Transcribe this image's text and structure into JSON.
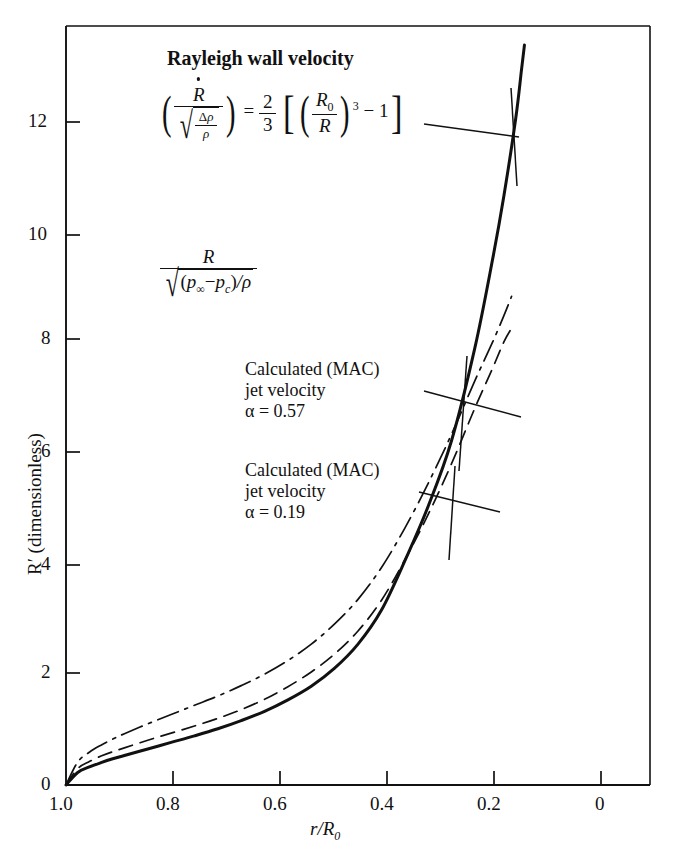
{
  "figure": {
    "kind": "scientific-line-chart",
    "background": "#ffffff",
    "ink": "#111111"
  },
  "axes": {
    "x": {
      "title_parts": {
        "r": "r",
        "slash": "/",
        "R": "R",
        "zero": "0"
      },
      "ticks": [
        "1.0",
        "0.8",
        "0.6",
        "0.4",
        "0.2",
        "0"
      ],
      "min": 1.0,
      "max": 0.0,
      "direction": "reversed"
    },
    "y": {
      "title": "R′ (dimensionless)",
      "ticks": [
        "0",
        "2",
        "4",
        "6",
        "8",
        "10",
        "12"
      ],
      "min": 0,
      "max": 13.9
    }
  },
  "annotations": {
    "rayleigh": {
      "headline": "Rayleigh wall velocity",
      "equation_text": "(Ṙ / √(Δρ/ρ)) = (2/3)[(R₀/R)³ − 1]",
      "parts": {
        "Rdot": "R",
        "delta": "Δ",
        "rho": "ρ",
        "equals": "=",
        "two": "2",
        "three": "3",
        "R0_R": "R",
        "sub0": "0",
        "R": "R",
        "exp3": "3",
        "minus": "−",
        "one": "1"
      }
    },
    "normalizer": {
      "equation_text": "R / √((p∞ − p_c)/ρ)",
      "parts": {
        "R": "R",
        "pinf": "p",
        "inf": "∞",
        "minus": "−",
        "pc": "p",
        "c": "c",
        "slashrho": "/ρ"
      }
    },
    "mac1": {
      "line1": "Calculated (MAC)",
      "line2": "jet velocity",
      "line3_prefix": "α = ",
      "alpha_value": "0.57"
    },
    "mac2": {
      "line1": "Calculated (MAC)",
      "line2": "jet velocity",
      "line3_prefix": "α = ",
      "alpha_value": "0.19"
    }
  },
  "chart_data": {
    "type": "line",
    "title": "",
    "xlabel": "r/R0",
    "ylabel": "R' (dimensionless)",
    "xlim": [
      1.0,
      0.0
    ],
    "ylim": [
      0,
      13.9
    ],
    "xticks": [
      1.0,
      0.8,
      0.6,
      0.4,
      0.2,
      0.0
    ],
    "yticks": [
      0,
      2,
      4,
      6,
      8,
      10,
      12
    ],
    "grid": false,
    "legend": "annotated-with-leader-lines",
    "x_axis_reversed": true,
    "series": [
      {
        "name": "Rayleigh wall velocity",
        "style": "solid-thick",
        "linewidth": 3.0,
        "x": [
          1.0,
          0.98,
          0.96,
          0.94,
          0.92,
          0.9,
          0.86,
          0.82,
          0.78,
          0.74,
          0.7,
          0.66,
          0.62,
          0.58,
          0.54,
          0.5,
          0.46,
          0.42,
          0.38,
          0.34,
          0.3,
          0.27,
          0.25,
          0.23,
          0.22,
          0.215
        ],
        "y": [
          0.0,
          0.23,
          0.33,
          0.41,
          0.48,
          0.54,
          0.66,
          0.78,
          0.9,
          1.03,
          1.18,
          1.35,
          1.56,
          1.81,
          2.14,
          2.58,
          3.2,
          4.1,
          5.1,
          6.3,
          8.0,
          9.6,
          10.8,
          12.2,
          13.1,
          13.55
        ]
      },
      {
        "name": "Calculated (MAC) jet velocity α = 0.19",
        "style": "dashed",
        "linewidth": 1.7,
        "dash": "14,8",
        "x": [
          1.0,
          0.98,
          0.96,
          0.94,
          0.92,
          0.9,
          0.86,
          0.82,
          0.78,
          0.74,
          0.7,
          0.66,
          0.62,
          0.58,
          0.54,
          0.5,
          0.46,
          0.42,
          0.38,
          0.34,
          0.3,
          0.27,
          0.25,
          0.235
        ],
        "y": [
          0.0,
          0.3,
          0.43,
          0.53,
          0.61,
          0.68,
          0.82,
          0.95,
          1.08,
          1.22,
          1.38,
          1.57,
          1.8,
          2.07,
          2.4,
          2.82,
          3.38,
          4.12,
          4.95,
          5.88,
          6.9,
          7.62,
          8.12,
          8.4
        ]
      },
      {
        "name": "Calculated (MAC) jet velocity α = 0.57",
        "style": "dash-dot-thin",
        "linewidth": 1.7,
        "dash": "22,7,3,7",
        "x": [
          1.0,
          0.98,
          0.96,
          0.94,
          0.92,
          0.9,
          0.86,
          0.82,
          0.78,
          0.74,
          0.7,
          0.66,
          0.62,
          0.58,
          0.54,
          0.5,
          0.46,
          0.42,
          0.38,
          0.34,
          0.3,
          0.27,
          0.25,
          0.237
        ],
        "y": [
          0.0,
          0.42,
          0.6,
          0.73,
          0.84,
          0.94,
          1.12,
          1.29,
          1.46,
          1.63,
          1.82,
          2.03,
          2.28,
          2.58,
          2.95,
          3.4,
          3.98,
          4.7,
          5.52,
          6.42,
          7.4,
          8.1,
          8.6,
          8.95
        ]
      }
    ]
  }
}
